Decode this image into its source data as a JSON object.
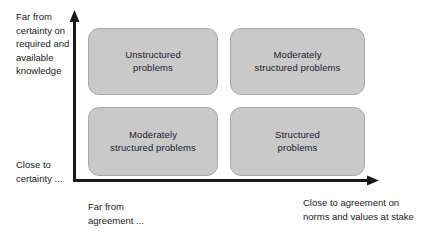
{
  "diagram": {
    "colors": {
      "box_fill": "#c9c9c9",
      "box_border": "#a8a8a8",
      "axis": "#1a1a1a",
      "text": "#1a1a2e"
    },
    "y_axis": {
      "top_label": "Far from\ncertainty on\nrequired and\navailable\nknowledge",
      "bottom_label": "Close to\ncertainty ..."
    },
    "x_axis": {
      "left_label": "Far from\nagreement ...",
      "right_label": "Close to agreement on\nnorms and values at stake"
    },
    "quadrants": [
      {
        "position": "top-left",
        "label": "Unstructured\nproblems"
      },
      {
        "position": "top-right",
        "label": "Moderately\nstructured problems"
      },
      {
        "position": "bottom-left",
        "label": "Moderately\nstructured problems"
      },
      {
        "position": "bottom-right",
        "label": "Structured\nproblems"
      }
    ]
  }
}
